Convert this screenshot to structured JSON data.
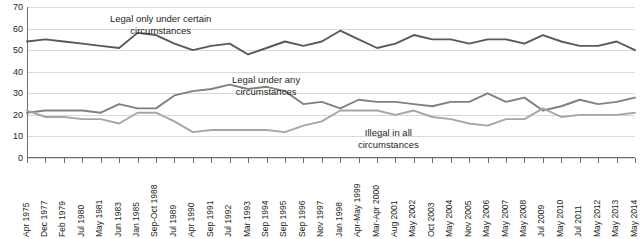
{
  "chart_data": {
    "type": "line",
    "title": "",
    "xlabel": "",
    "ylabel": "",
    "ylim": [
      0,
      70
    ],
    "yticks": [
      0,
      10,
      20,
      30,
      40,
      50,
      60,
      70
    ],
    "grid": true,
    "legend_position": "inline-annotations",
    "categories": [
      "Apr 1975",
      "Dec 1977",
      "Feb 1979",
      "Jul 1980",
      "May 1981",
      "Jun 1983",
      "Jan 1985",
      "Sep-Oct 1988",
      "Jul 1989",
      "Apr 1990",
      "Sep 1991",
      "Jul 1992",
      "Mar 1993",
      "Sep 1994",
      "Sep 1995",
      "Sep 1996",
      "Nov 1997",
      "Jan 1998",
      "Apr-May 1999",
      "Mar-Apr 2000",
      "Aug 2001",
      "May 2002",
      "Oct 2003",
      "May 2004",
      "Nov 2005",
      "May 2006",
      "May 2007",
      "May 2008",
      "Jul 2009",
      "May 2010",
      "Jul 2011",
      "May 2012",
      "May 2013",
      "May 2014"
    ],
    "series": [
      {
        "name": "Legal only under certain circumstances",
        "color": "#595959",
        "values": [
          54,
          55,
          54,
          53,
          52,
          51,
          58,
          57,
          53,
          50,
          52,
          53,
          48,
          51,
          54,
          52,
          54,
          59,
          55,
          51,
          53,
          57,
          55,
          55,
          53,
          55,
          55,
          53,
          57,
          54,
          52,
          52,
          54,
          50
        ]
      },
      {
        "name": "Legal under any circumstances",
        "color": "#808080",
        "values": [
          21,
          22,
          22,
          22,
          21,
          25,
          23,
          23,
          29,
          31,
          32,
          34,
          32,
          33,
          31,
          25,
          26,
          23,
          27,
          26,
          26,
          25,
          24,
          26,
          26,
          30,
          26,
          28,
          22,
          24,
          27,
          25,
          26,
          28
        ]
      },
      {
        "name": "Illegal in all circumstances",
        "color": "#a6a6a6",
        "values": [
          22,
          19,
          19,
          18,
          18,
          16,
          21,
          21,
          17,
          12,
          13,
          13,
          13,
          13,
          12,
          15,
          17,
          22,
          22,
          22,
          20,
          22,
          19,
          18,
          16,
          15,
          18,
          18,
          23,
          19,
          20,
          20,
          20,
          21
        ]
      }
    ],
    "annotations": [
      {
        "id": "legal-certain",
        "text": "Legal only under certain\ncircumstances"
      },
      {
        "id": "legal-any",
        "text": "Legal under any\ncircumstances"
      },
      {
        "id": "illegal",
        "text": "Illegal in all\ncircumstances"
      }
    ]
  }
}
